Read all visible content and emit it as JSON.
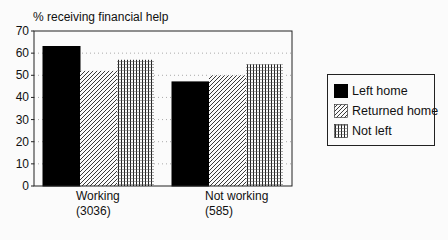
{
  "chart_data": {
    "type": "bar",
    "title": "% receiving financial help",
    "xlabel": "",
    "ylabel": "% receiving financial help",
    "ylim": [
      0,
      70
    ],
    "yticks": [
      0,
      10,
      20,
      30,
      40,
      50,
      60,
      70
    ],
    "grid": "dotted horizontal",
    "legend_position": "right",
    "categories": [
      "Working",
      "Not working"
    ],
    "category_counts": [
      "(3036)",
      "(585)"
    ],
    "series": [
      {
        "name": "Left home",
        "pattern": "solid-black",
        "values": [
          63,
          47
        ]
      },
      {
        "name": "Returned home",
        "pattern": "diagonal-hatch",
        "values": [
          52,
          50
        ]
      },
      {
        "name": "Not left",
        "pattern": "vertical-grid",
        "values": [
          57,
          55
        ]
      }
    ]
  },
  "legend": {
    "items": [
      {
        "label": "Left home"
      },
      {
        "label": "Returned home"
      },
      {
        "label": "Not left"
      }
    ]
  }
}
